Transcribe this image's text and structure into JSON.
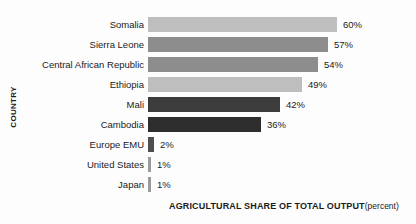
{
  "chart_data": {
    "type": "bar",
    "orientation": "horizontal",
    "title": "",
    "xlabel": "AGRICULTURAL SHARE OF TOTAL OUTPUT",
    "xlabel_unit": "(percent)",
    "ylabel": "COUNTRY",
    "xlim": [
      0,
      60
    ],
    "grid": false,
    "legend": "none",
    "categories": [
      "Somalia",
      "Sierra Leone",
      "Central African Republic",
      "Ethiopia",
      "Mali",
      "Cambodia",
      "Europe EMU",
      "United States",
      "Japan"
    ],
    "values": [
      60,
      57,
      54,
      49,
      42,
      36,
      2,
      1,
      1
    ],
    "value_labels": [
      "60%",
      "57%",
      "54%",
      "49%",
      "42%",
      "36%",
      "2%",
      "1%",
      "1%"
    ],
    "bar_colors": [
      "#bebebe",
      "#8d8d8d",
      "#8d8d8d",
      "#bebebe",
      "#3c3c3c",
      "#2e2e2e",
      "#4f4f4f",
      "#9a9a9a",
      "#9a9a9a"
    ]
  }
}
